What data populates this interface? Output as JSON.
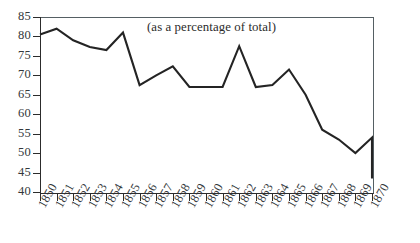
{
  "chart_data": {
    "type": "line",
    "title": "(as a percentage of total)",
    "xlabel": "",
    "ylabel": "",
    "xlim": [
      1850,
      1870
    ],
    "ylim": [
      40,
      85
    ],
    "ytick_step": 5,
    "grid": false,
    "legend": false,
    "axis_frame": "full-box",
    "line_color": "#242424",
    "categories": [
      "1850",
      "1851",
      "1852",
      "1853",
      "1854",
      "1855",
      "1856",
      "1857",
      "1858",
      "1859",
      "1860",
      "1861",
      "1862",
      "1863",
      "1864",
      "1865",
      "1866",
      "1867",
      "1868",
      "1869",
      "1870"
    ],
    "x": [
      1850,
      1851,
      1852,
      1853,
      1854,
      1855,
      1856,
      1857,
      1858,
      1859,
      1860,
      1861,
      1862,
      1863,
      1864,
      1865,
      1866,
      1867,
      1868,
      1869,
      1870
    ],
    "values": [
      80.5,
      82.0,
      79.0,
      77.3,
      76.5,
      81.0,
      67.5,
      70.0,
      72.3,
      67.0,
      67.0,
      67.0,
      77.5,
      67.0,
      67.5,
      71.5,
      65.0,
      56.0,
      53.5,
      50.0,
      54.0
    ],
    "yticks": [
      40,
      45,
      50,
      55,
      60,
      65,
      70,
      75,
      80,
      85
    ],
    "ytick_labels": [
      "40",
      "45",
      "50",
      "55",
      "60",
      "65",
      "70",
      "75",
      "80",
      "85"
    ]
  },
  "series_points": [
    {
      "year": "1850",
      "value": 80.5
    },
    {
      "year": "1851",
      "value": 82.0
    },
    {
      "year": "1852",
      "value": 79.0
    },
    {
      "year": "1853",
      "value": 77.3
    },
    {
      "year": "1854",
      "value": 76.5
    },
    {
      "year": "1855",
      "value": 81.0
    },
    {
      "year": "1856",
      "value": 67.5
    },
    {
      "year": "1857",
      "value": 70.0
    },
    {
      "year": "1858",
      "value": 72.3
    },
    {
      "year": "1859",
      "value": 67.0
    },
    {
      "year": "1860",
      "value": 67.0
    },
    {
      "year": "1861",
      "value": 67.0
    },
    {
      "year": "1862",
      "value": 77.5
    },
    {
      "year": "1863",
      "value": 67.0
    },
    {
      "year": "1864",
      "value": 67.5
    },
    {
      "year": "1865",
      "value": 71.5
    },
    {
      "year": "1866",
      "value": 65.0
    },
    {
      "year": "1867",
      "value": 56.0
    },
    {
      "year": "1868",
      "value": 53.5
    },
    {
      "year": "1869",
      "value": 50.0
    },
    {
      "year": "1870",
      "value": 54.0
    }
  ],
  "final_drop_value": 43.5,
  "colors": {
    "line": "#242424",
    "axis": "#2c2c2c",
    "frame_light": "#555f63",
    "text": "#33383b"
  }
}
